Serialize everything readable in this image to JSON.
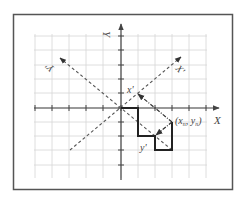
{
  "figure": {
    "width": 245,
    "height": 198,
    "frame": {
      "x": 13,
      "y": 14,
      "w": 220,
      "h": 176,
      "color": "#555555"
    },
    "grid": {
      "color": "#d4d4d4",
      "x_lines": [
        35,
        52,
        69,
        86,
        103,
        121,
        138,
        155,
        172,
        189,
        206
      ],
      "y_lines": [
        36,
        50,
        65,
        79,
        93,
        108,
        122,
        136,
        150,
        165
      ],
      "x_extent": [
        34,
        207
      ],
      "y_extent": [
        34,
        178
      ]
    },
    "origin": {
      "x": 121,
      "y": 108
    },
    "axes": {
      "color": "#444444",
      "x_axis": {
        "from": [
          34,
          108
        ],
        "to": [
          219,
          108
        ],
        "label": "X"
      },
      "y_axis": {
        "from": [
          121,
          180
        ],
        "to": [
          121,
          24
        ],
        "label": "Y"
      }
    },
    "rotated_axes": {
      "x_prime": {
        "from": [
          70,
          150
        ],
        "to": [
          181,
          57
        ],
        "label": "X'"
      },
      "y_prime": {
        "from": [
          172,
          150
        ],
        "to": [
          60,
          58
        ],
        "label": "Y'"
      }
    },
    "step_path": {
      "points": [
        [
          121,
          108
        ],
        [
          138,
          108
        ],
        [
          138,
          136
        ],
        [
          155,
          136
        ],
        [
          155,
          150
        ],
        [
          172,
          150
        ],
        [
          172,
          122
        ]
      ],
      "color": "#222222"
    },
    "projections": {
      "to_x_prime": {
        "from": [
          172,
          122
        ],
        "to": [
          138,
          94
        ],
        "label": "x'"
      },
      "to_y_prime": {
        "from": [
          172,
          122
        ],
        "to": [
          155,
          136
        ],
        "label": "y'"
      }
    },
    "point_label": {
      "text_open": "(x",
      "sub1": "n",
      "mid": ", y",
      "sub2": "n",
      "text_close": ")"
    },
    "labels": {
      "X": "X",
      "Y": "Y",
      "X_prime": "X'",
      "Y_prime": "Y'",
      "x_prime": "x'",
      "y_prime": "y'"
    }
  }
}
